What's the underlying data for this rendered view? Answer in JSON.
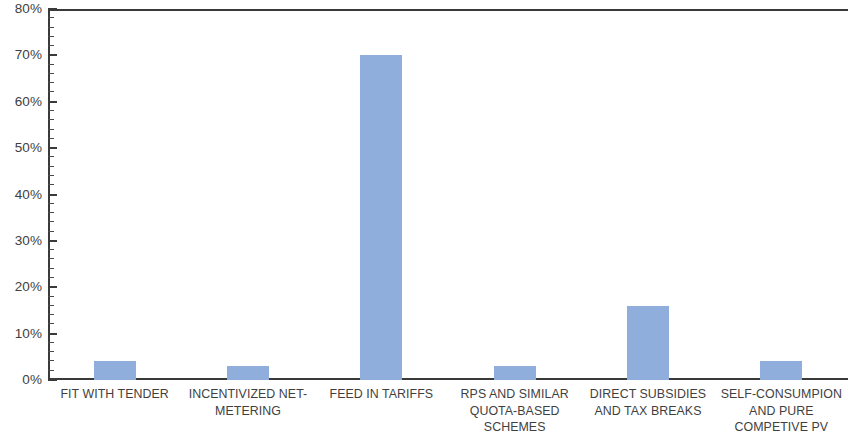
{
  "chart_data": {
    "type": "bar",
    "title": "",
    "subtitle": "",
    "xlabel": "",
    "ylabel": "",
    "ylim": [
      0,
      80
    ],
    "ytick_step": 10,
    "yminor_step": 2,
    "ytick_format": "percent",
    "grid": false,
    "legend": false,
    "bar_color": "#8faedc",
    "axis_color": "#3a3a3a",
    "categories": [
      "FIT WITH TENDER",
      "INCENTIVIZED NET-METERING",
      "FEED IN TARIFFS",
      "RPS AND SIMILAR QUOTA-BASED SCHEMES",
      "DIRECT SUBSIDIES AND TAX BREAKS",
      "SELF-CONSUMPION AND PURE COMPETIVE PV"
    ],
    "category_lines": [
      "FIT WITH TENDER",
      "INCENTIVIZED NET-\nMETERING",
      "FEED IN TARIFFS",
      "RPS AND SIMILAR\nQUOTA-BASED\nSCHEMES",
      "DIRECT SUBSIDIES\nAND TAX BREAKS",
      "SELF-CONSUMPION\nAND PURE\nCOMPETIVE PV"
    ],
    "values": [
      4,
      3,
      70,
      3,
      16,
      4
    ],
    "ytick_labels": [
      "80%",
      "70%",
      "60%",
      "50%",
      "40%",
      "30%",
      "20%",
      "10%",
      "0%"
    ],
    "ytick_values": [
      80,
      70,
      60,
      50,
      40,
      30,
      20,
      10,
      0
    ]
  }
}
